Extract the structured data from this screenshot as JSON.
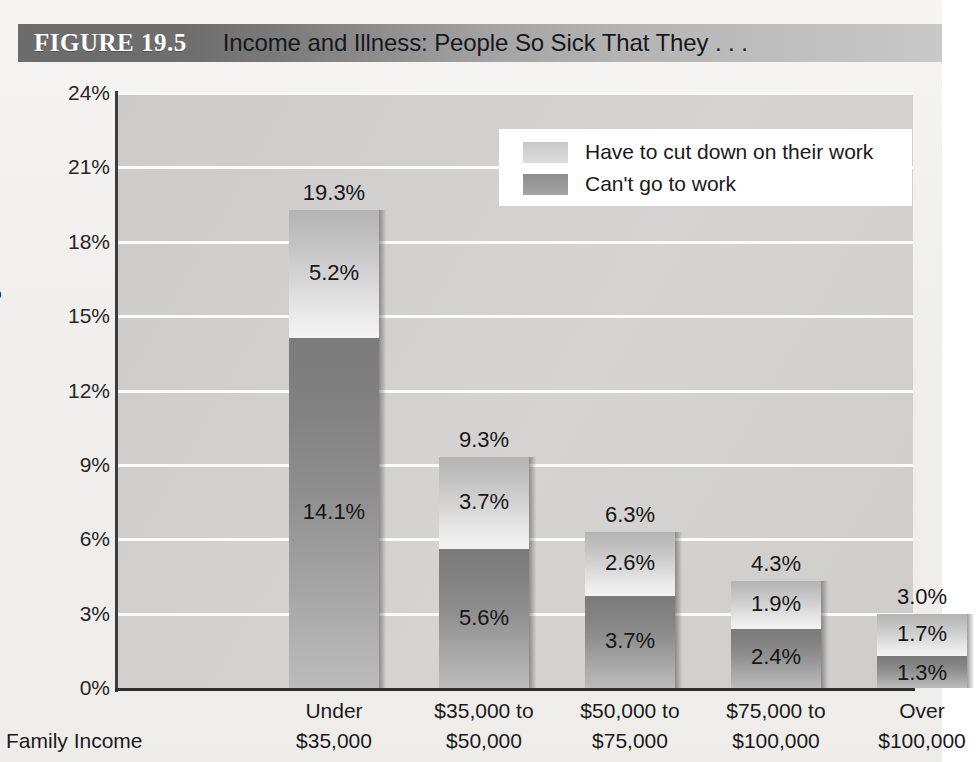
{
  "header": {
    "figure_label": "FIGURE 19.5",
    "title": "Income and Illness: People So Sick That They . . ."
  },
  "chart_data": {
    "type": "bar",
    "subtype": "stacked",
    "title": "Income and Illness: People So Sick That They . . .",
    "xlabel": "Family Income",
    "ylabel": "Percentage",
    "ylim": [
      0,
      24
    ],
    "yticks": [
      "0%",
      "3%",
      "6%",
      "9%",
      "12%",
      "15%",
      "18%",
      "21%",
      "24%"
    ],
    "ytick_values": [
      0,
      3,
      6,
      9,
      12,
      15,
      18,
      21,
      24
    ],
    "grid": true,
    "legend_position": "top-right",
    "categories": [
      "Under\n$35,000",
      "$35,000 to\n$50,000",
      "$50,000 to\n$75,000",
      "$75,000 to\n$100,000",
      "Over\n$100,000"
    ],
    "category_lines": [
      [
        "Under",
        "$35,000"
      ],
      [
        "$35,000 to",
        "$50,000"
      ],
      [
        "$50,000 to",
        "$75,000"
      ],
      [
        "$75,000 to",
        "$100,000"
      ],
      [
        "Over",
        "$100,000"
      ]
    ],
    "series": [
      {
        "name": "Can't go to work",
        "color": "#8f8f8f",
        "values": [
          14.1,
          5.6,
          3.7,
          2.4,
          1.3
        ],
        "labels": [
          "14.1%",
          "5.6%",
          "3.7%",
          "2.4%",
          "1.3%"
        ]
      },
      {
        "name": "Have to cut down on their work",
        "color": "#d4d4d4",
        "values": [
          5.2,
          3.7,
          2.6,
          1.9,
          1.7
        ],
        "labels": [
          "5.2%",
          "3.7%",
          "2.6%",
          "1.9%",
          "1.7%"
        ]
      }
    ],
    "totals": [
      19.3,
      9.3,
      6.3,
      4.3,
      3.0
    ],
    "total_labels": [
      "19.3%",
      "9.3%",
      "6.3%",
      "4.3%",
      "3.0%"
    ]
  },
  "legend": {
    "items": [
      {
        "label": "Have to cut down on their work",
        "swatch": "light"
      },
      {
        "label": "Can't go to work",
        "swatch": "dark"
      }
    ]
  },
  "colors": {
    "banner_dark": "#6c6c6c",
    "banner_light": "#c9c9c9",
    "plot_background": "#d2d0ce",
    "gridline": "#fbfbfa",
    "axis": "#2e2e2e",
    "page_background": "#f2f0ee"
  }
}
